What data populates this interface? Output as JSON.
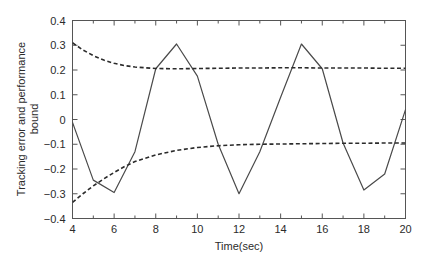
{
  "chart_data": {
    "type": "line",
    "title": "",
    "xlabel": "Time(sec)",
    "ylabel": "Tracking error and performance bound",
    "ylabel_line1": "Tracking error and performance",
    "ylabel_line2": "bound",
    "xlim": [
      4,
      20
    ],
    "ylim": [
      -0.4,
      0.4
    ],
    "xticks": [
      4,
      6,
      8,
      10,
      12,
      14,
      16,
      18,
      20
    ],
    "xtick_labels": [
      "4",
      "6",
      "8",
      "10",
      "12",
      "14",
      "16",
      "18",
      "20"
    ],
    "yticks": [
      -0.4,
      -0.3,
      -0.2,
      -0.1,
      0,
      0.1,
      0.2,
      0.3,
      0.4
    ],
    "ytick_labels": [
      "-0.4",
      "-0.3",
      "-0.2",
      "-0.1",
      "0",
      "0.1",
      "0.2",
      "0.3",
      "0.4"
    ],
    "grid": false,
    "legend": null,
    "minor_xticks": [
      5,
      7,
      9,
      11,
      13,
      15,
      17,
      19
    ],
    "series": [
      {
        "name": "tracking error",
        "style": "solid",
        "color": "#4a4a4a",
        "x": [
          4,
          5,
          6,
          7,
          8,
          9,
          10,
          11,
          12,
          13,
          14,
          15,
          16,
          17,
          18,
          19,
          20
        ],
        "values": [
          -0.012,
          -0.245,
          -0.295,
          -0.13,
          0.205,
          0.305,
          0.175,
          -0.1,
          -0.3,
          -0.13,
          0.09,
          0.305,
          0.205,
          -0.095,
          -0.285,
          -0.22,
          0.04
        ]
      },
      {
        "name": "upper performance bound",
        "style": "dashed",
        "color": "#2b2b2b",
        "x": [
          4,
          4.5,
          5,
          5.5,
          6,
          6.5,
          7,
          8,
          9,
          10,
          11,
          12,
          13,
          14,
          15,
          16,
          17,
          18,
          19,
          20
        ],
        "values": [
          0.31,
          0.281,
          0.258,
          0.24,
          0.227,
          0.218,
          0.212,
          0.206,
          0.205,
          0.206,
          0.207,
          0.208,
          0.208,
          0.209,
          0.209,
          0.208,
          0.208,
          0.208,
          0.207,
          0.207
        ]
      },
      {
        "name": "lower performance bound",
        "style": "dashed",
        "color": "#2b2b2b",
        "x": [
          4,
          4.5,
          5,
          5.5,
          6,
          6.5,
          7,
          8,
          9,
          10,
          11,
          12,
          13,
          14,
          15,
          16,
          17,
          18,
          19,
          20
        ],
        "values": [
          -0.335,
          -0.3,
          -0.268,
          -0.24,
          -0.214,
          -0.19,
          -0.17,
          -0.143,
          -0.125,
          -0.113,
          -0.106,
          -0.102,
          -0.1,
          -0.099,
          -0.098,
          -0.097,
          -0.096,
          -0.096,
          -0.095,
          -0.095
        ]
      }
    ]
  }
}
